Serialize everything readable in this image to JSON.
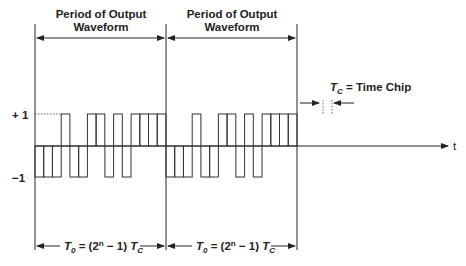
{
  "title_left": {
    "line1": "Period of Output",
    "line2": "Waveform"
  },
  "title_right": {
    "line1": "Period of Output",
    "line2": "Waveform"
  },
  "chip_label": {
    "sym": "T",
    "sub": "C",
    "text": " = Time Chip"
  },
  "y_labels": {
    "plus": "+ 1",
    "minus": "−1"
  },
  "axis_label": "t",
  "period_label": {
    "sym": "T",
    "sub": "0",
    "eq": " = (2",
    "sup": "n",
    "rest": " − 1) ",
    "sym2": "T",
    "sub2": "C"
  },
  "colors": {
    "line": "#222222",
    "dotted": "#555555"
  },
  "chart_data": {
    "type": "diagram",
    "levels": [
      1,
      -1
    ],
    "chips_per_period": 15,
    "sequence": [
      -1,
      -1,
      -1,
      1,
      -1,
      -1,
      1,
      1,
      -1,
      1,
      -1,
      1,
      1,
      1,
      1
    ],
    "periods_shown": 2,
    "annotations": [
      "Period of Output Waveform",
      "T_C = Time Chip",
      "T_0 = (2^n - 1) T_C"
    ]
  }
}
